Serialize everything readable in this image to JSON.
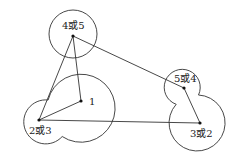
{
  "diagram": {
    "points": [
      {
        "id": "p1",
        "label": "1",
        "x": 81,
        "y": 101
      },
      {
        "id": "p23",
        "label": "2或3",
        "x": 39,
        "y": 120
      },
      {
        "id": "p45",
        "label": "4或5",
        "x": 73,
        "y": 36
      },
      {
        "id": "p54",
        "label": "5或4",
        "x": 184,
        "y": 88
      },
      {
        "id": "p32",
        "label": "3或2",
        "x": 200,
        "y": 123
      }
    ],
    "labels": {
      "p1": "1",
      "p23": "2或3",
      "p45": "4或5",
      "p54": "5或4",
      "p32": "3或2"
    },
    "colors": {
      "stroke": "#333333",
      "background": "#ffffff"
    }
  }
}
